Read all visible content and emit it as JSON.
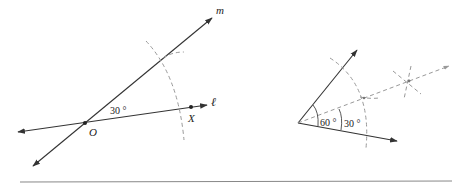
{
  "figure_left": {
    "line_m_label": "m",
    "line_l_label": "ℓ",
    "point_o_label": "O",
    "point_x_label": "X",
    "angle_label": "30 °"
  },
  "figure_right": {
    "angle_large_label": "60 °",
    "angle_small_label": "30 °"
  },
  "colors": {
    "stroke": "#333333",
    "construction": "#999999",
    "background": "#ffffff"
  }
}
